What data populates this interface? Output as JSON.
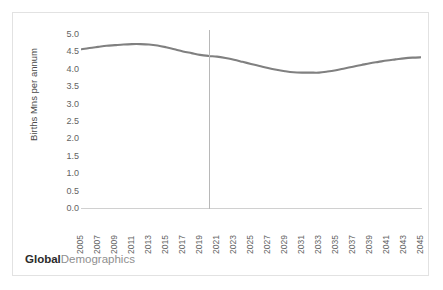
{
  "brand": {
    "primary": "Global",
    "secondary": "Demographics"
  },
  "colors": {
    "line": "#808080",
    "axis": "#d0d0d0",
    "divider": "#b8b8b8",
    "tick_text": "#636363",
    "border": "#e2e2e2",
    "background": "#ffffff"
  },
  "chart_data": {
    "type": "line",
    "title": "",
    "subtitle": "",
    "xlabel": "",
    "ylabel": "Births Mns per annum",
    "ylim": [
      0.0,
      5.0
    ],
    "ytick_labels": [
      "5.0",
      "4.5",
      "4.0",
      "3.5",
      "3.0",
      "2.5",
      "2.0",
      "1.5",
      "1.0",
      "0.5",
      "0.0"
    ],
    "ytick_values": [
      5.0,
      4.5,
      4.0,
      3.5,
      3.0,
      2.5,
      2.0,
      1.5,
      1.0,
      0.5,
      0.0
    ],
    "grid": false,
    "legend": null,
    "xlim": [
      2005,
      2045
    ],
    "xtick_labels": [
      "2005",
      "2007",
      "2009",
      "2011",
      "2013",
      "2015",
      "2017",
      "2019",
      "2021",
      "2023",
      "2025",
      "2027",
      "2029",
      "2031",
      "2033",
      "2035",
      "2037",
      "2039",
      "2041",
      "2043",
      "2045"
    ],
    "categories": [
      2005,
      2006,
      2007,
      2008,
      2009,
      2010,
      2011,
      2012,
      2013,
      2014,
      2015,
      2016,
      2017,
      2018,
      2019,
      2020,
      2021,
      2022,
      2023,
      2024,
      2025,
      2026,
      2027,
      2028,
      2029,
      2030,
      2031,
      2032,
      2033,
      2034,
      2035,
      2036,
      2037,
      2038,
      2039,
      2040,
      2041,
      2042,
      2043,
      2044,
      2045
    ],
    "series": [
      {
        "name": "Births Mns per annum",
        "color": "#808080",
        "values": [
          4.56,
          4.6,
          4.63,
          4.66,
          4.68,
          4.7,
          4.71,
          4.71,
          4.7,
          4.67,
          4.62,
          4.56,
          4.5,
          4.45,
          4.4,
          4.37,
          4.35,
          4.31,
          4.26,
          4.2,
          4.14,
          4.08,
          4.02,
          3.97,
          3.93,
          3.9,
          3.89,
          3.89,
          3.89,
          3.92,
          3.96,
          4.01,
          4.06,
          4.11,
          4.16,
          4.2,
          4.24,
          4.27,
          4.3,
          4.32,
          4.33
        ]
      }
    ],
    "annotations": [
      {
        "type": "vertical-line",
        "name": "forecast-divider",
        "x": 2020,
        "color": "#b8b8b8",
        "label": ""
      }
    ]
  }
}
